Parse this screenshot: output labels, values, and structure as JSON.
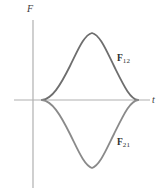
{
  "figure": {
    "background_color": "#ffffff",
    "axis_color": "#b0b0b0",
    "curve_color": "#6e6e6e",
    "label_color": "#2e2e2e"
  },
  "axes": {
    "vertical": {
      "name": "force-axis",
      "label": "F",
      "label_style": "italic",
      "x": 33,
      "y_top": 20,
      "y_bottom": 188
    },
    "horizontal": {
      "name": "time-axis",
      "label": "t",
      "label_style": "italic",
      "y": 100,
      "x_left": 14,
      "x_right": 150
    }
  },
  "curves": [
    {
      "name": "force-curve-f12",
      "label_symbol": "F",
      "label_subscript": "12",
      "label_x": 117,
      "label_y": 54,
      "description": "Positive force pulse above the time axis",
      "peak": {
        "t": 92,
        "F": 33
      },
      "zero_crossings": [
        42,
        138
      ]
    },
    {
      "name": "force-curve-f21",
      "label_symbol": "F",
      "label_subscript": "21",
      "label_x": 117,
      "label_y": 138,
      "description": "Negative force pulse below the time axis, mirror of F12",
      "trough": {
        "t": 92,
        "F": 168
      },
      "zero_crossings": [
        42,
        138
      ]
    }
  ],
  "chart_data": {
    "type": "line",
    "title": "",
    "xlabel": "t",
    "ylabel": "F",
    "grid": false,
    "legend": "inline-annotations",
    "xlim": [
      0,
      166
    ],
    "ylim": [
      -1.1,
      1.1
    ],
    "annotations": [
      {
        "text": "F12",
        "x": 117,
        "y": 54
      },
      {
        "text": "F21",
        "x": 117,
        "y": 138
      }
    ],
    "series": [
      {
        "name": "F12",
        "x": [
          42,
          50,
          58,
          66,
          74,
          82,
          88,
          92,
          96,
          102,
          110,
          118,
          126,
          132,
          138
        ],
        "y": [
          0.0,
          0.07,
          0.18,
          0.36,
          0.58,
          0.81,
          0.93,
          0.97,
          0.95,
          0.84,
          0.63,
          0.41,
          0.21,
          0.09,
          0.0
        ],
        "path": "M 42,100 C 52,99 60,86 70,66 C 78,50 84,35 92,33 C 100,35 106,50 114,66 C 124,86 130,99 138,100",
        "color": "#6e6e6e",
        "width": 1.8
      },
      {
        "name": "F21",
        "x": [
          42,
          50,
          58,
          66,
          74,
          82,
          88,
          92,
          96,
          102,
          110,
          118,
          126,
          132,
          138
        ],
        "y": [
          0.0,
          -0.07,
          -0.18,
          -0.36,
          -0.58,
          -0.81,
          -0.93,
          -0.97,
          -0.95,
          -0.84,
          -0.63,
          -0.41,
          -0.21,
          -0.09,
          0.0
        ],
        "path": "M 42,100 C 52,101 60,114 70,134 C 78,150 84,165 92,168 C 100,165 106,150 114,134 C 124,114 130,101 138,100",
        "color": "#8a8a8a",
        "width": 1.8
      }
    ]
  }
}
